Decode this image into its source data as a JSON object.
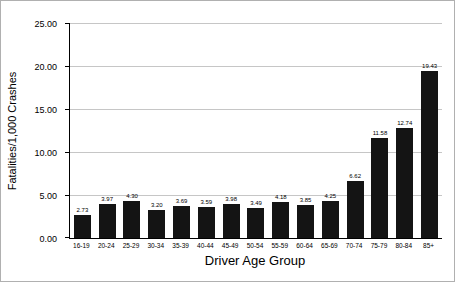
{
  "chart_data": {
    "type": "bar",
    "title": "",
    "xlabel": "Driver Age Group",
    "ylabel": "Fatalities/1,000 Crashes",
    "categories": [
      "16-19",
      "20-24",
      "25-29",
      "30-34",
      "35-39",
      "40-44",
      "45-49",
      "50-54",
      "55-59",
      "60-64",
      "65-69",
      "70-74",
      "75-79",
      "80-84",
      "85+"
    ],
    "values": [
      2.73,
      3.97,
      4.3,
      3.2,
      3.69,
      3.59,
      3.98,
      3.49,
      4.18,
      3.85,
      4.25,
      6.62,
      11.58,
      12.74,
      19.43
    ],
    "value_labels": [
      "2.73",
      "3.97",
      "4.30",
      "3.20",
      "3.69",
      "3.59",
      "3.98",
      "3.49",
      "4.18",
      "3.85",
      "4.25",
      "6.62",
      "11.58",
      "12.74",
      "19.43"
    ],
    "ylim": [
      0,
      25
    ],
    "yticks": [
      0,
      5,
      10,
      15,
      20,
      25
    ],
    "ytick_labels": [
      "0.00",
      "5.00",
      "10.00",
      "15.00",
      "20.00",
      "25.00"
    ],
    "grid": "horizontal",
    "legend": "none",
    "bar_color": "#141414",
    "gridline_color": "#c6c6c6"
  }
}
